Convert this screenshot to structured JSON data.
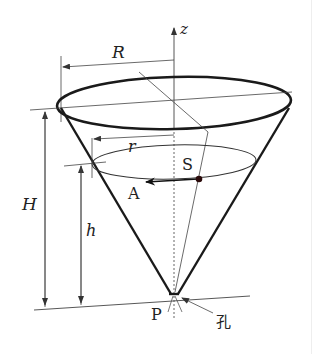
{
  "figure": {
    "type": "cone-container-diagram",
    "labels": {
      "z_axis": "z",
      "top_radius": "R",
      "liquid_radius": "r",
      "total_height": "H",
      "liquid_height": "h",
      "surface_area": "S",
      "point_a": "A",
      "apex": "P",
      "hole": "孔"
    },
    "colors": {
      "stroke": "#222222",
      "thin_stroke": "#444444",
      "background": "#ffffff"
    }
  }
}
